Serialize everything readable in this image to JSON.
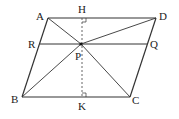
{
  "diagram": {
    "type": "geometry",
    "colors": {
      "line": "#333333",
      "dashed": "#555555",
      "text": "#222222",
      "background": "#ffffff"
    },
    "points": {
      "A": {
        "label": "A",
        "x": 48,
        "y": 18
      },
      "D": {
        "label": "D",
        "x": 156,
        "y": 18
      },
      "B": {
        "label": "B",
        "x": 22,
        "y": 97
      },
      "C": {
        "label": "C",
        "x": 130,
        "y": 97
      },
      "H": {
        "label": "H",
        "x": 82,
        "y": 18
      },
      "K": {
        "label": "K",
        "x": 82,
        "y": 97
      },
      "P": {
        "label": "P",
        "x": 81,
        "y": 44
      },
      "R": {
        "label": "R",
        "x": 40,
        "y": 44
      },
      "Q": {
        "label": "Q",
        "x": 147,
        "y": 44
      }
    },
    "labels": {
      "A": "A",
      "H": "H",
      "D": "D",
      "R": "R",
      "Q": "Q",
      "P": "P",
      "B": "B",
      "K": "K",
      "C": "C"
    },
    "segments": [
      {
        "from": "A",
        "to": "D",
        "style": "solid"
      },
      {
        "from": "D",
        "to": "C",
        "style": "solid"
      },
      {
        "from": "C",
        "to": "B",
        "style": "solid"
      },
      {
        "from": "B",
        "to": "A",
        "style": "solid"
      },
      {
        "from": "R",
        "to": "Q",
        "style": "solid"
      },
      {
        "from": "P",
        "to": "A",
        "style": "solid"
      },
      {
        "from": "P",
        "to": "B",
        "style": "solid"
      },
      {
        "from": "P",
        "to": "C",
        "style": "solid"
      },
      {
        "from": "P",
        "to": "D",
        "style": "solid"
      },
      {
        "from": "H",
        "to": "K",
        "style": "dashed"
      }
    ],
    "right_angle_markers": [
      "H",
      "K"
    ]
  }
}
